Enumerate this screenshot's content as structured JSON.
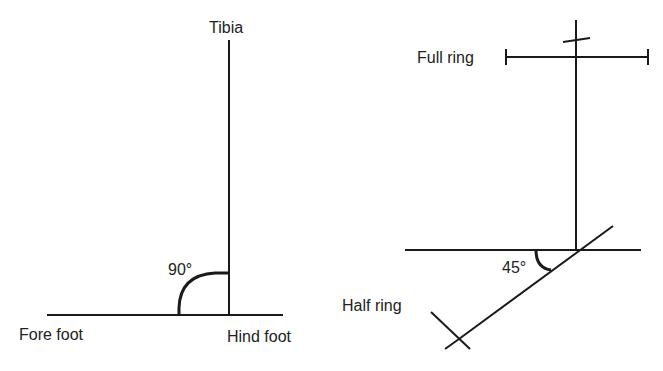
{
  "left_diagram": {
    "labels": {
      "top": "Tibia",
      "bottom_left": "Fore foot",
      "bottom_right": "Hind foot",
      "angle": "90°"
    }
  },
  "right_diagram": {
    "labels": {
      "top_ring": "Full ring",
      "bottom_ring": "Half ring",
      "angle": "45°"
    }
  },
  "colors": {
    "line": "#1a1a1a",
    "text": "#222222",
    "background": "#ffffff"
  }
}
